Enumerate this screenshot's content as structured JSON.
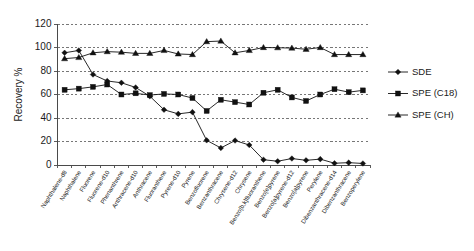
{
  "chart_data": {
    "type": "line",
    "title": "",
    "xlabel": "",
    "ylabel": "Recovery %",
    "ylim": [
      0,
      120
    ],
    "ytick_values": [
      0,
      20,
      40,
      60,
      80,
      100,
      120
    ],
    "ytick_labels": [
      "0",
      "20",
      "40",
      "60",
      "80",
      "100",
      "120"
    ],
    "grid": "horizontal-dashed",
    "legend_position": "right",
    "categories": [
      "Naphthalene-d8",
      "Naphthalene",
      "Fluorene",
      "Fluorene-d10",
      "Phenanthrene",
      "Anthracene-d10",
      "Anthracene",
      "Fluoranthene",
      "Pyrene-d10",
      "Pyrene",
      "Benzofluorene",
      "Benzanthracene",
      "Chrysene-d12",
      "Chrysene",
      "Benzo[b,k]fluoranthene",
      "Benzo[e]pyrene",
      "Benzo[a]pyrene-d12",
      "Benzo[a]pyrene",
      "Perylene",
      "Dibenzanthracene-d14",
      "Dibenzanthracene",
      "Benzoperylene"
    ],
    "series": [
      {
        "name": "SDE",
        "marker": "diamond",
        "color": "#111111",
        "values": [
          95.5,
          97.5,
          77.0,
          71.5,
          70.0,
          66.0,
          58.5,
          47.0,
          43.5,
          45.0,
          21.0,
          14.5,
          20.8,
          17.0,
          4.5,
          3.2,
          5.5,
          4.0,
          5.0,
          1.5,
          2.0,
          1.3
        ]
      },
      {
        "name": "SPE (C18)",
        "marker": "square",
        "color": "#111111",
        "values": [
          64.0,
          65.0,
          66.5,
          68.5,
          60.0,
          61.0,
          59.5,
          60.5,
          60.0,
          57.0,
          46.0,
          55.5,
          53.5,
          51.5,
          61.5,
          64.0,
          57.5,
          54.5,
          60.0,
          64.5,
          62.0,
          63.5
        ]
      },
      {
        "name": "SPE (CH)",
        "marker": "triangle",
        "color": "#111111",
        "values": [
          90.5,
          91.5,
          95.5,
          96.5,
          96.0,
          95.0,
          95.0,
          97.5,
          94.5,
          94.0,
          105.0,
          105.5,
          95.5,
          97.5,
          100.0,
          99.8,
          99.5,
          98.5,
          100.0,
          94.0,
          94.0,
          94.0
        ]
      }
    ]
  },
  "legend": {
    "entries": [
      {
        "label": "SDE"
      },
      {
        "label": "SPE (C18)"
      },
      {
        "label": "SPE (CH)"
      }
    ]
  }
}
